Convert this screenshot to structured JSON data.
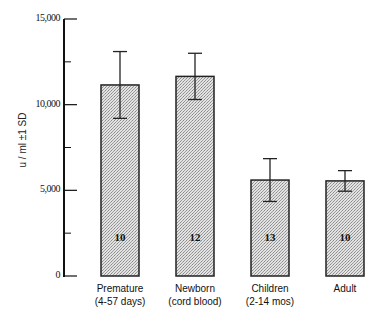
{
  "chart_data": {
    "type": "bar",
    "title": "",
    "xlabel": "",
    "ylabel": "u / ml  ±1 SD",
    "ylim": [
      0,
      15000
    ],
    "yticks": [
      0,
      5000,
      10000,
      15000
    ],
    "ytick_labels": [
      "0",
      "5,000",
      "10,000",
      "15,000"
    ],
    "minor_yticks": [
      2500,
      7500,
      12500
    ],
    "grid": false,
    "legend": null,
    "categories": [
      "Premature (4-57 days)",
      "Newborn (cord blood)",
      "Children (2-14 mos)",
      "Adult"
    ],
    "category_lines": [
      [
        "Premature",
        "(4-57 days)"
      ],
      [
        "Newborn",
        "(cord blood)"
      ],
      [
        "Children",
        "(2-14 mos)"
      ],
      [
        "Adult"
      ]
    ],
    "values": [
      11150,
      11650,
      5600,
      5550
    ],
    "error_sd": [
      1950,
      1350,
      1250,
      600
    ],
    "n": [
      "10",
      "12",
      "13",
      "10"
    ],
    "bar_fill": "#cfcfcf",
    "bar_stroke": "#222222"
  }
}
